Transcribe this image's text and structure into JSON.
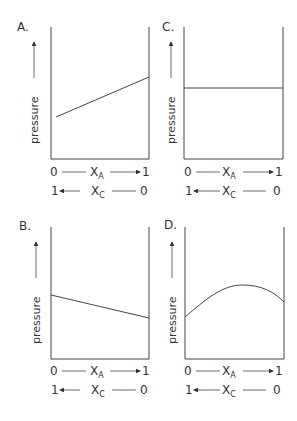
{
  "figure": {
    "panels": [
      {
        "id": "A",
        "label": "A.",
        "curve": "linear-increasing"
      },
      {
        "id": "B",
        "label": "B.",
        "curve": "linear-decreasing"
      },
      {
        "id": "C",
        "label": "C.",
        "curve": "constant"
      },
      {
        "id": "D",
        "label": "D.",
        "curve": "positive-deviation-maximum"
      }
    ],
    "y_axis_label": "pressure",
    "x_axis_top": {
      "start": "0",
      "var": "X",
      "sub": "A",
      "end": "1"
    },
    "x_axis_bottom": {
      "start": "1",
      "var": "X",
      "sub": "C",
      "end": "0"
    }
  },
  "colors": {
    "ink": "#333333",
    "background": "#ffffff"
  }
}
